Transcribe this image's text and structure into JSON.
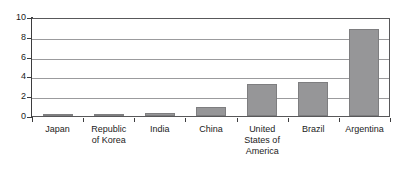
{
  "chart_data": {
    "type": "bar",
    "title": "",
    "subtitle": "",
    "xlabel": "",
    "ylabel": "",
    "categories": [
      "Japan",
      "Republic of Korea",
      "India",
      "China",
      "United States of America",
      "Brazil",
      "Argentina"
    ],
    "category_lines": [
      [
        "Japan"
      ],
      [
        "Republic",
        "of Korea"
      ],
      [
        "India"
      ],
      [
        "China"
      ],
      [
        "United",
        "States of",
        "America"
      ],
      [
        "Brazil"
      ],
      [
        "Argentina"
      ]
    ],
    "values": [
      0.15,
      0.15,
      0.3,
      0.9,
      3.25,
      3.4,
      8.75
    ],
    "ylim": [
      0,
      10
    ],
    "y_ticks": [
      0,
      2,
      4,
      6,
      8,
      10
    ],
    "y_tick_labels": [
      "0",
      "2",
      "4",
      "6",
      "8",
      "10"
    ],
    "grid": true,
    "grid_axis": "y",
    "legend": false,
    "legend_position": "none",
    "series": [
      {
        "name": "",
        "values": [
          0.15,
          0.15,
          0.3,
          0.9,
          3.25,
          3.4,
          8.75
        ]
      }
    ]
  },
  "style": {
    "bar_fill": "#969698",
    "bar_stroke": "#7e7e80",
    "gridline_color": "#9b9b9d",
    "axis_color": "#3d3d3f",
    "frame_color": "#58585a",
    "text_color": "#1b1b1b",
    "background": "#ffffff"
  }
}
